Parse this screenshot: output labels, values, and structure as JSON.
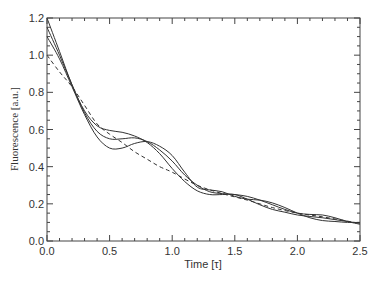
{
  "chart_data": {
    "type": "line",
    "title": "",
    "xlabel": "Time [τ]",
    "ylabel": "Fluorescence [a.u.]",
    "xlim": [
      0,
      2.5
    ],
    "ylim": [
      0,
      1.2
    ],
    "x_ticks": [
      "0.0",
      "0.5",
      "1.0",
      "1.5",
      "2.0",
      "2.5"
    ],
    "y_ticks": [
      "0.0",
      "0.2",
      "0.4",
      "0.6",
      "0.8",
      "1.0",
      "1.2"
    ],
    "grid": false,
    "legend": null,
    "series": [
      {
        "name": "curve-1",
        "style": "solid",
        "x": [
          0,
          0.1,
          0.2,
          0.3,
          0.4,
          0.5,
          0.6,
          0.7,
          0.8,
          0.9,
          1.0,
          1.1,
          1.2,
          1.3,
          1.4,
          1.5,
          1.6,
          1.7,
          1.8,
          1.9,
          2.0,
          2.1,
          2.2,
          2.3,
          2.4,
          2.5
        ],
        "y": [
          1.2,
          1.02,
          0.84,
          0.7,
          0.62,
          0.595,
          0.585,
          0.565,
          0.53,
          0.47,
          0.39,
          0.32,
          0.27,
          0.25,
          0.25,
          0.25,
          0.225,
          0.195,
          0.17,
          0.155,
          0.14,
          0.132,
          0.125,
          0.115,
          0.105,
          0.095
        ]
      },
      {
        "name": "curve-2",
        "style": "solid",
        "x": [
          0,
          0.1,
          0.2,
          0.3,
          0.4,
          0.5,
          0.6,
          0.7,
          0.8,
          0.9,
          1.0,
          1.1,
          1.2,
          1.3,
          1.4,
          1.5,
          1.6,
          1.7,
          1.8,
          1.9,
          2.0,
          2.1,
          2.2,
          2.3,
          2.4,
          2.5
        ],
        "y": [
          1.15,
          1.0,
          0.84,
          0.69,
          0.59,
          0.55,
          0.55,
          0.555,
          0.535,
          0.49,
          0.43,
          0.355,
          0.3,
          0.265,
          0.255,
          0.25,
          0.24,
          0.22,
          0.195,
          0.17,
          0.15,
          0.143,
          0.14,
          0.125,
          0.105,
          0.09
        ]
      },
      {
        "name": "curve-3",
        "style": "solid",
        "x": [
          0,
          0.1,
          0.2,
          0.3,
          0.4,
          0.5,
          0.6,
          0.7,
          0.8,
          0.9,
          1.0,
          1.1,
          1.2,
          1.3,
          1.4,
          1.5,
          1.6,
          1.7,
          1.8,
          1.9,
          2.0,
          2.1,
          2.2,
          2.3,
          2.4,
          2.5
        ],
        "y": [
          1.1,
          0.98,
          0.83,
          0.68,
          0.56,
          0.5,
          0.5,
          0.525,
          0.535,
          0.51,
          0.46,
          0.37,
          0.29,
          0.275,
          0.265,
          0.24,
          0.225,
          0.22,
          0.205,
          0.18,
          0.15,
          0.125,
          0.11,
          0.105,
          0.1,
          0.1
        ]
      },
      {
        "name": "curve-dashed",
        "style": "dashed",
        "x": [
          0,
          0.1,
          0.2,
          0.3,
          0.4,
          0.5,
          0.6,
          0.7,
          0.8,
          0.9,
          1.0,
          1.2,
          1.4,
          1.6,
          1.8,
          2.0,
          2.2,
          2.5
        ],
        "y": [
          1.0,
          0.91,
          0.83,
          0.73,
          0.63,
          0.575,
          0.53,
          0.48,
          0.44,
          0.4,
          0.37,
          0.3,
          0.255,
          0.22,
          0.18,
          0.15,
          0.13,
          0.095
        ]
      }
    ]
  }
}
